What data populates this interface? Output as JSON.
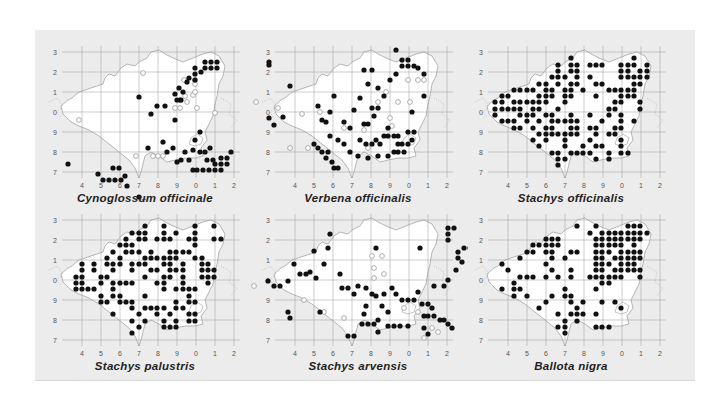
{
  "figure": {
    "background": "#ececec",
    "land_color": "#ffffff",
    "grid_color": "#9a9a9a",
    "present_color": "#111111",
    "old_record_color": "#9a9a9a",
    "x_ticks": [
      "4",
      "5",
      "6",
      "7",
      "8",
      "9",
      "0",
      "1",
      "2"
    ],
    "y_ticks": [
      "3",
      "2",
      "1",
      "0",
      "9",
      "8",
      "7"
    ]
  },
  "maps": [
    {
      "title": "Cynoglossum officinale",
      "dots": [
        [
          33,
          124
        ],
        [
          63,
          134
        ],
        [
          68,
          140
        ],
        [
          74,
          140
        ],
        [
          78,
          128
        ],
        [
          84,
          128
        ],
        [
          80,
          140
        ],
        [
          86,
          140
        ],
        [
          90,
          136
        ],
        [
          92,
          146
        ],
        [
          104,
          157
        ],
        [
          108,
          162
        ],
        [
          110,
          168
        ],
        [
          110,
          174
        ],
        [
          116,
          166
        ],
        [
          116,
          172
        ],
        [
          116,
          178
        ],
        [
          104,
          170
        ],
        [
          104,
          176
        ],
        [
          98,
          170
        ],
        [
          98,
          176
        ],
        [
          110,
          162
        ],
        [
          104,
          57
        ],
        [
          116,
          74
        ],
        [
          122,
          66
        ],
        [
          130,
          66
        ],
        [
          140,
          80
        ],
        [
          148,
          52
        ],
        [
          146,
          60
        ],
        [
          160,
          100
        ],
        [
          165,
          92
        ],
        [
          170,
          112
        ],
        [
          175,
          108
        ],
        [
          178,
          120
        ],
        [
          172,
          120
        ],
        [
          165,
          112
        ],
        [
          158,
          110
        ],
        [
          154,
          120
        ],
        [
          150,
          112
        ],
        [
          146,
          120
        ],
        [
          142,
          122
        ],
        [
          158,
          130
        ],
        [
          162,
          130
        ],
        [
          168,
          130
        ],
        [
          174,
          130
        ],
        [
          180,
          130
        ],
        [
          186,
          130
        ],
        [
          180,
          124
        ],
        [
          186,
          124
        ],
        [
          192,
          124
        ],
        [
          186,
          118
        ],
        [
          192,
          118
        ],
        [
          196,
          112
        ],
        [
          166,
          32
        ],
        [
          170,
          22
        ],
        [
          176,
          22
        ],
        [
          182,
          22
        ],
        [
          182,
          28
        ],
        [
          176,
          28
        ],
        [
          170,
          28
        ],
        [
          160,
          28
        ],
        [
          160,
          34
        ],
        [
          160,
          40
        ],
        [
          152,
          42
        ],
        [
          154,
          38
        ],
        [
          144,
          48
        ],
        [
          140,
          54
        ],
        [
          142,
          60
        ],
        [
          145,
          60
        ],
        [
          128,
          102
        ],
        [
          132,
          112
        ],
        [
          138,
          108
        ],
        [
          113,
          108
        ]
      ],
      "old": [
        [
          44,
          80
        ],
        [
          108,
          33
        ],
        [
          150,
          56
        ],
        [
          160,
          44
        ],
        [
          160,
          40
        ],
        [
          152,
          62
        ],
        [
          162,
          68
        ],
        [
          158,
          55
        ],
        [
          180,
          73
        ],
        [
          101,
          116
        ],
        [
          118,
          116
        ],
        [
          123,
          116
        ],
        [
          128,
          116
        ],
        [
          145,
          68
        ],
        [
          140,
          68
        ],
        [
          149,
          40
        ],
        [
          160,
          52
        ]
      ]
    },
    {
      "title": "Verbena officinalis",
      "dots": [
        [
          21,
          78
        ],
        [
          26,
          85
        ],
        [
          35,
          77
        ],
        [
          21,
          22
        ],
        [
          21,
          25
        ],
        [
          42,
          46
        ],
        [
          70,
          66
        ],
        [
          74,
          80
        ],
        [
          78,
          82
        ],
        [
          82,
          72
        ],
        [
          86,
          56
        ],
        [
          96,
          82
        ],
        [
          102,
          88
        ],
        [
          106,
          70
        ],
        [
          112,
          58
        ],
        [
          120,
          44
        ],
        [
          116,
          30
        ],
        [
          124,
          30
        ],
        [
          116,
          84
        ],
        [
          120,
          84
        ],
        [
          126,
          76
        ],
        [
          124,
          68
        ],
        [
          130,
          68
        ],
        [
          112,
          100
        ],
        [
          118,
          104
        ],
        [
          124,
          104
        ],
        [
          128,
          100
        ],
        [
          132,
          104
        ],
        [
          136,
          96
        ],
        [
          140,
          88
        ],
        [
          140,
          96
        ],
        [
          146,
          96
        ],
        [
          150,
          96
        ],
        [
          150,
          104
        ],
        [
          154,
          104
        ],
        [
          146,
          112
        ],
        [
          150,
          112
        ],
        [
          156,
          112
        ],
        [
          160,
          104
        ],
        [
          164,
          100
        ],
        [
          160,
          92
        ],
        [
          166,
          92
        ],
        [
          130,
          48
        ],
        [
          136,
          56
        ],
        [
          142,
          40
        ],
        [
          148,
          34
        ],
        [
          154,
          20
        ],
        [
          160,
          20
        ],
        [
          154,
          26
        ],
        [
          160,
          26
        ],
        [
          166,
          26
        ],
        [
          148,
          10
        ],
        [
          170,
          28
        ],
        [
          176,
          34
        ],
        [
          164,
          72
        ],
        [
          176,
          56
        ],
        [
          66,
          104
        ],
        [
          70,
          108
        ],
        [
          74,
          112
        ],
        [
          78,
          118
        ],
        [
          80,
          112
        ],
        [
          84,
          122
        ],
        [
          86,
          128
        ],
        [
          90,
          128
        ],
        [
          96,
          104
        ],
        [
          90,
          100
        ],
        [
          82,
          96
        ],
        [
          102,
          112
        ],
        [
          110,
          116
        ],
        [
          120,
          118
        ],
        [
          130,
          116
        ],
        [
          140,
          116
        ]
      ],
      "old": [
        [
          8,
          62
        ],
        [
          30,
          68
        ],
        [
          42,
          108
        ],
        [
          116,
          90
        ],
        [
          130,
          62
        ],
        [
          138,
          52
        ],
        [
          150,
          62
        ],
        [
          162,
          62
        ],
        [
          160,
          40
        ],
        [
          170,
          40
        ],
        [
          176,
          40
        ],
        [
          142,
          78
        ],
        [
          144,
          86
        ],
        [
          120,
          108
        ],
        [
          60,
          108
        ],
        [
          54,
          74
        ],
        [
          72,
          72
        ],
        [
          96,
          88
        ]
      ]
    },
    {
      "title": "Stachys officinalis",
      "dots": []
    },
    {
      "title": "Stachys palustris",
      "dots": []
    },
    {
      "title": "Stachys arvensis",
      "dots": [
        [
          20,
          73
        ],
        [
          26,
          78
        ],
        [
          32,
          78
        ],
        [
          40,
          73
        ],
        [
          46,
          56
        ],
        [
          52,
          66
        ],
        [
          58,
          66
        ],
        [
          62,
          64
        ],
        [
          68,
          70
        ],
        [
          40,
          104
        ],
        [
          42,
          110
        ],
        [
          72,
          104
        ],
        [
          66,
          43
        ],
        [
          76,
          56
        ],
        [
          92,
          66
        ],
        [
          94,
          80
        ],
        [
          100,
          80
        ],
        [
          106,
          86
        ],
        [
          110,
          78
        ],
        [
          118,
          80
        ],
        [
          124,
          86
        ],
        [
          128,
          88
        ],
        [
          136,
          86
        ],
        [
          144,
          80
        ],
        [
          148,
          86
        ],
        [
          154,
          92
        ],
        [
          160,
          92
        ],
        [
          166,
          92
        ],
        [
          170,
          84
        ],
        [
          174,
          96
        ],
        [
          180,
          96
        ],
        [
          184,
          100
        ],
        [
          176,
          108
        ],
        [
          180,
          108
        ],
        [
          186,
          108
        ],
        [
          192,
          112
        ],
        [
          196,
          112
        ],
        [
          200,
          116
        ],
        [
          204,
          120
        ],
        [
          176,
          120
        ],
        [
          180,
          126
        ],
        [
          160,
          118
        ],
        [
          152,
          118
        ],
        [
          146,
          118
        ],
        [
          140,
          118
        ],
        [
          130,
          124
        ],
        [
          126,
          116
        ],
        [
          120,
          116
        ],
        [
          130,
          112
        ],
        [
          100,
          128
        ],
        [
          106,
          128
        ],
        [
          114,
          116
        ],
        [
          116,
          106
        ],
        [
          118,
          98
        ],
        [
          134,
          98
        ],
        [
          140,
          104
        ],
        [
          186,
          78
        ],
        [
          196,
          78
        ],
        [
          200,
          72
        ],
        [
          208,
          62
        ],
        [
          214,
          54
        ],
        [
          210,
          50
        ],
        [
          210,
          44
        ],
        [
          216,
          40
        ],
        [
          222,
          40
        ],
        [
          230,
          40
        ],
        [
          244,
          40
        ],
        [
          200,
          32
        ],
        [
          200,
          26
        ],
        [
          200,
          20
        ],
        [
          206,
          20
        ],
        [
          172,
          40
        ],
        [
          128,
          40
        ],
        [
          82,
          26
        ],
        [
          80,
          40
        ]
      ],
      "old": [
        [
          6,
          78
        ],
        [
          56,
          92
        ],
        [
          76,
          104
        ],
        [
          96,
          110
        ],
        [
          126,
          70
        ],
        [
          126,
          60
        ],
        [
          136,
          66
        ],
        [
          124,
          48
        ],
        [
          134,
          48
        ],
        [
          156,
          100
        ],
        [
          170,
          104
        ],
        [
          184,
          120
        ],
        [
          176,
          130
        ],
        [
          190,
          124
        ]
      ]
    },
    {
      "title": "Ballota nigra",
      "dots": []
    }
  ]
}
